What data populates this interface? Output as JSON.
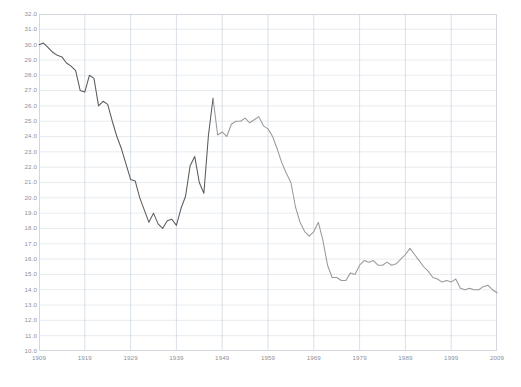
{
  "chart_data": {
    "type": "line",
    "title": "",
    "subtitle": "",
    "xlabel": "",
    "ylabel": "",
    "xlim": [
      1909,
      2009
    ],
    "ylim": [
      10.0,
      32.0
    ],
    "grid": true,
    "legend": null,
    "legend_position": "none",
    "line_color": "#5a5a5a",
    "line_color_secondary": "#9a9a9a",
    "grid_color": "#dde3ea",
    "axis_color": "#d3d8de",
    "tick_text_color": "#8d9199",
    "background_color": "#ffffff",
    "ytick_labels": [
      "32.0",
      "31.0",
      "30.0",
      "29.0",
      "28.0",
      "27.0",
      "26.0",
      "25.0",
      "24.0",
      "23.0",
      "22.0",
      "21.0",
      "20.0",
      "19.0",
      "18.0",
      "17.0",
      "16.0",
      "15.0",
      "14.0",
      "13.0",
      "12.0",
      "11.0",
      "10.0"
    ],
    "ytick_values": [
      32.0,
      31.0,
      30.0,
      29.0,
      28.0,
      27.0,
      26.0,
      25.0,
      24.0,
      23.0,
      22.0,
      21.0,
      20.0,
      19.0,
      18.0,
      17.0,
      16.0,
      15.0,
      14.0,
      13.0,
      12.0,
      11.0,
      10.0
    ],
    "xtick_labels": [
      "1909",
      "1919",
      "1929",
      "1939",
      "1949",
      "1959",
      "1969",
      "1979",
      "1989",
      "1999",
      "2009"
    ],
    "xtick_values": [
      1909,
      1919,
      1929,
      1939,
      1949,
      1959,
      1969,
      1979,
      1989,
      1999,
      2009
    ],
    "x": [
      1909,
      1910,
      1911,
      1912,
      1913,
      1914,
      1915,
      1916,
      1917,
      1918,
      1919,
      1920,
      1921,
      1922,
      1923,
      1924,
      1925,
      1926,
      1927,
      1928,
      1929,
      1930,
      1931,
      1932,
      1933,
      1934,
      1935,
      1936,
      1937,
      1938,
      1939,
      1940,
      1941,
      1942,
      1943,
      1944,
      1945,
      1946,
      1947,
      1948,
      1949,
      1950,
      1951,
      1952,
      1953,
      1954,
      1955,
      1956,
      1957,
      1958,
      1959,
      1960,
      1961,
      1962,
      1963,
      1964,
      1965,
      1966,
      1967,
      1968,
      1969,
      1970,
      1971,
      1972,
      1973,
      1974,
      1975,
      1976,
      1977,
      1978,
      1979,
      1980,
      1981,
      1982,
      1983,
      1984,
      1985,
      1986,
      1987,
      1988,
      1989,
      1990,
      1991,
      1992,
      1993,
      1994,
      1995,
      1996,
      1997,
      1998,
      1999,
      2000,
      2001,
      2002,
      2003,
      2004,
      2005,
      2006,
      2007,
      2008,
      2009
    ],
    "values": [
      30.0,
      30.1,
      29.8,
      29.5,
      29.3,
      29.2,
      28.8,
      28.6,
      28.3,
      27.0,
      26.9,
      28.0,
      27.8,
      26.0,
      26.3,
      26.1,
      25.0,
      24.0,
      23.2,
      22.2,
      21.2,
      21.1,
      20.0,
      19.2,
      18.4,
      19.0,
      18.3,
      18.0,
      18.5,
      18.6,
      18.2,
      19.3,
      20.1,
      22.1,
      22.7,
      21.0,
      20.3,
      24.1,
      26.5,
      24.1,
      24.3,
      24.0,
      24.8,
      25.0,
      25.0,
      25.2,
      24.9,
      25.1,
      25.3,
      24.7,
      24.5,
      24.0,
      23.2,
      22.3,
      21.6,
      21.0,
      19.4,
      18.4,
      17.8,
      17.5,
      17.8,
      18.4,
      17.2,
      15.6,
      14.8,
      14.8,
      14.6,
      14.6,
      15.1,
      15.0,
      15.6,
      15.9,
      15.8,
      15.9,
      15.6,
      15.6,
      15.8,
      15.6,
      15.7,
      16.0,
      16.3,
      16.7,
      16.3,
      15.9,
      15.5,
      15.2,
      14.8,
      14.7,
      14.5,
      14.6,
      14.5,
      14.7,
      14.1,
      14.0,
      14.1,
      14.0,
      14.0,
      14.2,
      14.3,
      14.0,
      13.8
    ]
  }
}
